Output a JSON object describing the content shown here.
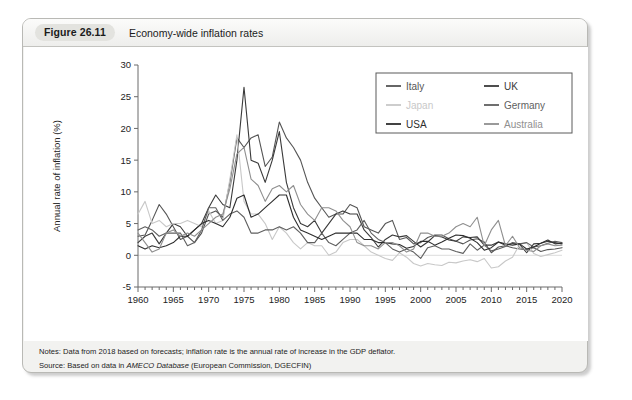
{
  "figure": {
    "number_label": "Figure 26.11",
    "title": "Economy-wide inflation rates"
  },
  "notes": {
    "notes_prefix": "Notes:",
    "notes_text": "Data from 2018 based on forecasts; inflation rate is the annual rate of increase in the GDP deflator.",
    "source_prefix": "Source:",
    "source_pre": "Based on data in",
    "source_italic": "AMECO Database",
    "source_post": "(European Commission, DGECFIN)"
  },
  "chart_data": {
    "type": "line",
    "title": "Economy-wide inflation rates",
    "xlabel": "",
    "ylabel": "Annual rate of inflation (%)",
    "xlim": [
      1960,
      2020
    ],
    "ylim": [
      -5,
      30
    ],
    "yticks": [
      -5,
      0,
      5,
      10,
      15,
      20,
      25,
      30
    ],
    "xticks": [
      1960,
      1965,
      1970,
      1975,
      1980,
      1985,
      1990,
      1995,
      2000,
      2005,
      2010,
      2015,
      2020
    ],
    "minor_xtick_step": 1,
    "grid": false,
    "zero_line": true,
    "legend_position": "top-right",
    "legend_columns": 2,
    "x": [
      1960,
      1961,
      1962,
      1963,
      1964,
      1965,
      1966,
      1967,
      1968,
      1969,
      1970,
      1971,
      1972,
      1973,
      1974,
      1975,
      1976,
      1977,
      1978,
      1979,
      1980,
      1981,
      1982,
      1983,
      1984,
      1985,
      1986,
      1987,
      1988,
      1989,
      1990,
      1991,
      1992,
      1993,
      1994,
      1995,
      1996,
      1997,
      1998,
      1999,
      2000,
      2001,
      2002,
      2003,
      2004,
      2005,
      2006,
      2007,
      2008,
      2009,
      2010,
      2011,
      2012,
      2013,
      2014,
      2015,
      2016,
      2017,
      2018,
      2019,
      2020
    ],
    "series": [
      {
        "name": "Italy",
        "color": "#555555",
        "values": [
          3.0,
          3.2,
          5.5,
          8.0,
          6.5,
          4.5,
          2.5,
          3.0,
          2.0,
          3.5,
          6.5,
          7.0,
          6.0,
          11.5,
          18.5,
          17.0,
          18.5,
          19.0,
          14.0,
          15.5,
          21.0,
          18.5,
          17.0,
          15.0,
          11.5,
          9.0,
          7.5,
          6.0,
          6.5,
          6.5,
          8.0,
          7.5,
          4.5,
          4.0,
          3.5,
          5.0,
          5.5,
          2.5,
          2.8,
          1.8,
          2.0,
          2.8,
          3.2,
          3.2,
          2.6,
          2.2,
          1.8,
          2.4,
          2.6,
          2.1,
          0.4,
          1.3,
          1.5,
          1.2,
          1.0,
          0.9,
          1.2,
          0.6,
          0.9,
          1.0,
          1.2
        ]
      },
      {
        "name": "UK",
        "color": "#3a3a3a",
        "values": [
          2.0,
          3.0,
          3.5,
          1.8,
          3.5,
          5.0,
          4.5,
          3.0,
          4.0,
          5.0,
          7.5,
          9.5,
          8.0,
          7.5,
          15.0,
          26.5,
          15.0,
          14.5,
          11.5,
          15.0,
          19.5,
          11.5,
          7.5,
          5.0,
          4.5,
          5.5,
          3.5,
          5.0,
          6.5,
          7.0,
          6.5,
          6.5,
          4.0,
          2.8,
          1.3,
          2.5,
          3.2,
          2.9,
          3.1,
          2.2,
          1.3,
          2.1,
          3.1,
          2.9,
          2.4,
          2.2,
          2.9,
          2.8,
          2.9,
          1.6,
          1.6,
          2.1,
          1.6,
          1.9,
          1.7,
          0.4,
          1.8,
          1.9,
          2.2,
          2.0,
          1.8
        ]
      },
      {
        "name": "Japan",
        "color": "#c8c8c8",
        "values": [
          6.5,
          8.5,
          5.0,
          5.5,
          4.5,
          5.0,
          5.0,
          5.5,
          5.0,
          4.5,
          7.0,
          5.0,
          5.5,
          12.0,
          19.0,
          8.5,
          6.5,
          6.5,
          5.0,
          2.5,
          4.5,
          3.5,
          2.0,
          1.0,
          2.0,
          1.5,
          1.5,
          0.0,
          0.5,
          2.0,
          2.5,
          2.5,
          1.5,
          0.5,
          0.0,
          -0.5,
          -0.8,
          0.4,
          -0.3,
          -1.3,
          -1.7,
          -1.3,
          -1.5,
          -1.6,
          -1.1,
          -1.2,
          -0.9,
          -0.7,
          -1.0,
          -0.5,
          -2.0,
          -1.8,
          -0.9,
          -0.3,
          1.7,
          2.0,
          0.3,
          -0.2,
          0.1,
          0.4,
          0.8
        ]
      },
      {
        "name": "Germany",
        "color": "#5f5f5f",
        "values": [
          4.0,
          4.5,
          4.0,
          3.0,
          3.5,
          3.5,
          3.5,
          1.5,
          2.0,
          4.0,
          7.5,
          7.5,
          5.5,
          6.5,
          7.0,
          6.0,
          3.5,
          3.5,
          4.0,
          4.0,
          4.5,
          4.0,
          4.5,
          3.5,
          2.0,
          2.0,
          3.5,
          2.0,
          1.5,
          2.5,
          3.5,
          4.0,
          5.5,
          3.5,
          2.5,
          2.0,
          1.0,
          0.5,
          1.0,
          0.5,
          -0.5,
          1.2,
          1.5,
          1.0,
          1.0,
          0.6,
          0.3,
          1.8,
          0.8,
          1.6,
          0.7,
          1.0,
          1.4,
          2.0,
          1.8,
          2.0,
          1.3,
          1.5,
          1.9,
          2.2,
          2.0
        ]
      },
      {
        "name": "USA",
        "color": "#2e2e2e",
        "values": [
          1.5,
          1.0,
          1.5,
          1.2,
          1.5,
          2.0,
          3.0,
          3.0,
          4.0,
          5.0,
          5.5,
          5.0,
          4.5,
          6.0,
          9.0,
          9.5,
          6.0,
          6.5,
          7.5,
          8.5,
          9.5,
          9.5,
          6.0,
          4.0,
          3.5,
          3.0,
          2.5,
          3.0,
          3.5,
          3.5,
          3.5,
          3.5,
          2.5,
          2.5,
          2.0,
          2.0,
          1.8,
          1.7,
          1.1,
          1.4,
          2.2,
          2.2,
          1.6,
          2.1,
          2.7,
          3.2,
          3.1,
          2.7,
          2.0,
          0.8,
          1.2,
          2.1,
          1.8,
          1.6,
          1.8,
          1.0,
          1.3,
          1.9,
          2.4,
          1.8,
          1.9
        ]
      },
      {
        "name": "Australia",
        "color": "#8f8f8f",
        "values": [
          3.5,
          2.0,
          0.5,
          1.0,
          3.5,
          4.0,
          3.0,
          3.5,
          3.0,
          4.0,
          5.0,
          6.0,
          6.5,
          10.5,
          16.0,
          17.0,
          12.0,
          11.0,
          8.5,
          10.5,
          11.0,
          10.0,
          11.0,
          8.0,
          6.5,
          5.5,
          7.5,
          7.5,
          7.0,
          5.5,
          4.5,
          2.0,
          1.5,
          1.5,
          1.0,
          2.0,
          2.0,
          1.5,
          0.5,
          1.0,
          3.5,
          3.5,
          3.0,
          3.0,
          3.5,
          4.5,
          5.0,
          4.5,
          6.0,
          1.5,
          4.0,
          5.5,
          1.5,
          3.0,
          1.2,
          0.8,
          0.6,
          1.5,
          1.8,
          1.5,
          1.6
        ]
      }
    ]
  }
}
